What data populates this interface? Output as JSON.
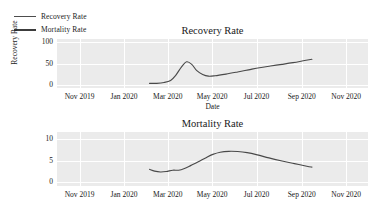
{
  "legend": {
    "position": "top-left",
    "items": [
      {
        "label": "Recovery Rate",
        "color": "#4d4d4d"
      },
      {
        "label": "Mortality Rate",
        "color": "#3c3c3c"
      }
    ]
  },
  "style": {
    "plot_background": "#ebebeb",
    "gridline_color": "#ffffff",
    "line_color": "#494949",
    "text_color": "#1a1a1a"
  },
  "chart_data": [
    {
      "type": "line",
      "title": "Recovery Rate",
      "xlabel": "Date",
      "ylabel": "Recovery Rate",
      "grid": true,
      "legend_position": "top-left",
      "ylim": [
        -8,
        108
      ],
      "yticks": [
        0,
        50,
        100
      ],
      "ytick_labels": [
        "0",
        "50",
        "100"
      ],
      "xlim": [
        "2019-10-01",
        "2020-12-01"
      ],
      "xticks": [
        "2019-11-01",
        "2020-01-01",
        "2020-03-01",
        "2020-05-01",
        "2020-07-01",
        "2020-09-01",
        "2020-11-01"
      ],
      "xtick_labels": [
        "Nov 2019",
        "Jan 2020",
        "Mar 2020",
        "May 2020",
        "Jul 2020",
        "Sep 2020",
        "Nov 2020"
      ],
      "series": [
        {
          "name": "Recovery Rate",
          "x": [
            "2020-02-05",
            "2020-02-15",
            "2020-02-25",
            "2020-03-05",
            "2020-03-12",
            "2020-03-20",
            "2020-03-27",
            "2020-04-03",
            "2020-04-10",
            "2020-04-18",
            "2020-04-26",
            "2020-05-05",
            "2020-05-20",
            "2020-06-05",
            "2020-06-20",
            "2020-07-05",
            "2020-07-20",
            "2020-08-05",
            "2020-08-20",
            "2020-09-05",
            "2020-09-15"
          ],
          "y": [
            3,
            3,
            5,
            10,
            22,
            42,
            54,
            48,
            33,
            24,
            20,
            21,
            25,
            30,
            35,
            40,
            44,
            48,
            52,
            57,
            60
          ]
        }
      ]
    },
    {
      "type": "line",
      "title": "Mortality Rate",
      "xlabel": "",
      "ylabel": "",
      "grid": true,
      "legend_position": "top-left",
      "ylim": [
        -0.8,
        11.5
      ],
      "yticks": [
        0,
        5,
        10
      ],
      "ytick_labels": [
        "0",
        "5",
        "10"
      ],
      "xlim": [
        "2019-10-01",
        "2020-12-01"
      ],
      "xticks": [
        "2019-11-01",
        "2020-01-01",
        "2020-03-01",
        "2020-05-01",
        "2020-07-01",
        "2020-09-01",
        "2020-11-01"
      ],
      "xtick_labels": [
        "Nov 2019",
        "Jan 2020",
        "Mar 2020",
        "May 2020",
        "Jul 2020",
        "Sep 2020",
        "Nov 2020"
      ],
      "series": [
        {
          "name": "Mortality Rate",
          "x": [
            "2020-02-05",
            "2020-02-12",
            "2020-02-20",
            "2020-02-28",
            "2020-03-08",
            "2020-03-16",
            "2020-03-24",
            "2020-04-02",
            "2020-04-12",
            "2020-04-22",
            "2020-05-02",
            "2020-05-12",
            "2020-05-24",
            "2020-06-05",
            "2020-06-18",
            "2020-07-02",
            "2020-07-18",
            "2020-08-05",
            "2020-08-22",
            "2020-09-08",
            "2020-09-15"
          ],
          "y": [
            3.0,
            2.6,
            2.4,
            2.5,
            2.8,
            2.8,
            3.2,
            3.9,
            4.7,
            5.6,
            6.4,
            6.9,
            7.1,
            7.05,
            6.8,
            6.3,
            5.6,
            4.9,
            4.3,
            3.7,
            3.5
          ]
        }
      ]
    }
  ]
}
